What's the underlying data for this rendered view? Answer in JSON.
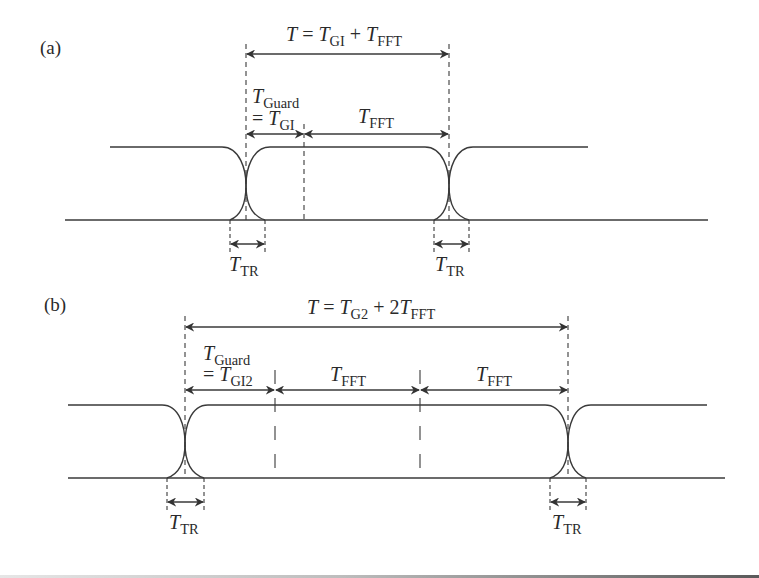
{
  "figure": {
    "panels": [
      {
        "id": "a",
        "tag": "(a)",
        "period_label": {
          "T": "T",
          "eq": " = ",
          "T1": "T",
          "sub1": "GI",
          "plus": " + ",
          "T2": "T",
          "sub2": "FFT"
        },
        "guard_label": {
          "T": "T",
          "sub": "Guard",
          "eq": "= ",
          "T2": "T",
          "sub2": "GI"
        },
        "fft_labels": [
          {
            "T": "T",
            "sub": "FFT"
          }
        ],
        "tr_labels": [
          {
            "T": "T",
            "sub": "TR"
          },
          {
            "T": "T",
            "sub": "TR"
          }
        ]
      },
      {
        "id": "b",
        "tag": "(b)",
        "period_label": {
          "T": "T",
          "eq": " = ",
          "T1": "T",
          "sub1": "G2",
          "plus": " + 2",
          "T2": "T",
          "sub2": "FFT"
        },
        "guard_label": {
          "T": "T",
          "sub": "Guard",
          "eq": "= ",
          "T2": "T",
          "sub2": "GI2"
        },
        "fft_labels": [
          {
            "T": "T",
            "sub": "FFT"
          },
          {
            "T": "T",
            "sub": "FFT"
          }
        ],
        "tr_labels": [
          {
            "T": "T",
            "sub": "TR"
          },
          {
            "T": "T",
            "sub": "TR"
          }
        ]
      }
    ],
    "colors": {
      "line": "#3a3a3a",
      "text": "#2a2a2a",
      "background": "#ffffff"
    }
  }
}
